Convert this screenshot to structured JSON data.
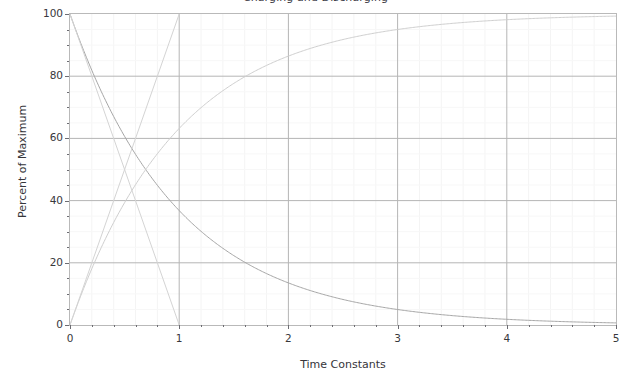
{
  "chart_data": {
    "type": "line",
    "title": "Charging and Discharging",
    "xlabel": "Time Constants",
    "ylabel": "Percent of Maximum",
    "xlim": [
      0,
      5
    ],
    "ylim": [
      0,
      100
    ],
    "grid": true,
    "grid_axis": "both",
    "legend": "none",
    "x_ticks": [
      0,
      1,
      2,
      3,
      4,
      5
    ],
    "x_tick_labels": [
      "0",
      "1",
      "2",
      "3",
      "4",
      "5"
    ],
    "x_minor_step": 0.2,
    "y_ticks": [
      0,
      20,
      40,
      60,
      80,
      100
    ],
    "y_tick_labels": [
      "0",
      "20",
      "40",
      "60",
      "80",
      "100"
    ],
    "y_minor_step": 5,
    "series": [
      {
        "name": "discharge-exponential",
        "kind": "exponential-decay",
        "color": "#a6a6a6",
        "x": [
          0,
          0.2,
          0.4,
          0.6,
          0.8,
          1,
          1.2,
          1.4,
          1.6,
          1.8,
          2,
          2.5,
          3,
          3.5,
          4,
          4.5,
          5
        ],
        "values": [
          100,
          81.9,
          67,
          54.9,
          44.9,
          36.8,
          30.1,
          24.7,
          20.2,
          16.5,
          13.5,
          8.2,
          5,
          3,
          1.8,
          1.1,
          0.7
        ]
      },
      {
        "name": "charge-exponential",
        "kind": "exponential-rise",
        "color": "#cfcfcf",
        "x": [
          0,
          0.2,
          0.4,
          0.6,
          0.8,
          1,
          1.2,
          1.4,
          1.6,
          1.8,
          2,
          2.5,
          3,
          3.5,
          4,
          4.5,
          5
        ],
        "values": [
          0,
          18.1,
          33,
          45.1,
          55.1,
          63.2,
          69.9,
          75.3,
          79.8,
          83.5,
          86.5,
          91.8,
          95,
          97,
          98.2,
          98.9,
          99.3
        ]
      },
      {
        "name": "discharge-tangent-line",
        "kind": "straight-line",
        "color": "#d4d4d4",
        "x": [
          0,
          1
        ],
        "values": [
          100,
          0
        ]
      },
      {
        "name": "charge-tangent-line",
        "kind": "straight-line",
        "color": "#d4d4d4",
        "x": [
          0,
          1
        ],
        "values": [
          0,
          100
        ]
      }
    ]
  }
}
